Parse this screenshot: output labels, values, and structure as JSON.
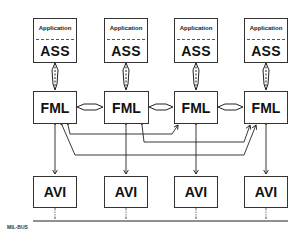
{
  "diagram": {
    "type": "block-diagram",
    "columns": 4,
    "application_label": "Application",
    "ass_label": "ASS",
    "fml_label": "FML",
    "avi_label": "AVI",
    "bus_label": "MIL-BUS",
    "ass_boxes": [
      {
        "app": "Application",
        "label": "ASS"
      },
      {
        "app": "Application",
        "label": "ASS"
      },
      {
        "app": "Application",
        "label": "ASS"
      },
      {
        "app": "Application",
        "label": "ASS"
      }
    ],
    "fml_boxes": [
      {
        "label": "FML"
      },
      {
        "label": "FML"
      },
      {
        "label": "FML"
      },
      {
        "label": "FML"
      }
    ],
    "avi_boxes": [
      {
        "label": "AVI"
      },
      {
        "label": "AVI"
      },
      {
        "label": "AVI"
      },
      {
        "label": "AVI"
      }
    ],
    "connections": [
      {
        "from": "ASS-1",
        "to": "FML-1",
        "type": "bidirectional-hollow"
      },
      {
        "from": "ASS-2",
        "to": "FML-2",
        "type": "bidirectional-hollow"
      },
      {
        "from": "ASS-3",
        "to": "FML-3",
        "type": "bidirectional-hollow"
      },
      {
        "from": "ASS-4",
        "to": "FML-4",
        "type": "bidirectional-hollow"
      },
      {
        "from": "FML-1",
        "to": "FML-2",
        "type": "bidirectional-hollow"
      },
      {
        "from": "FML-2",
        "to": "FML-3",
        "type": "bidirectional-hollow"
      },
      {
        "from": "FML-3",
        "to": "FML-4",
        "type": "bidirectional-hollow"
      },
      {
        "from": "FML-1",
        "to": "FML-3",
        "type": "bidirectional-routed"
      },
      {
        "from": "FML-2",
        "to": "FML-4",
        "type": "bidirectional-routed"
      },
      {
        "from": "FML-1",
        "to": "FML-4",
        "type": "bidirectional-routed"
      },
      {
        "from": "FML-1",
        "to": "AVI-1",
        "type": "bidirectional"
      },
      {
        "from": "FML-2",
        "to": "AVI-2",
        "type": "bidirectional"
      },
      {
        "from": "FML-3",
        "to": "AVI-3",
        "type": "bidirectional"
      },
      {
        "from": "FML-4",
        "to": "AVI-4",
        "type": "bidirectional"
      },
      {
        "from": "AVI-1",
        "to": "MIL-BUS",
        "type": "dotted-bidirectional"
      },
      {
        "from": "AVI-2",
        "to": "MIL-BUS",
        "type": "dotted-bidirectional"
      },
      {
        "from": "AVI-3",
        "to": "MIL-BUS",
        "type": "dotted-bidirectional"
      },
      {
        "from": "AVI-4",
        "to": "MIL-BUS",
        "type": "dotted-bidirectional"
      }
    ]
  }
}
